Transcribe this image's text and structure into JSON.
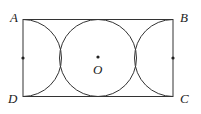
{
  "diagram": {
    "labels": {
      "A": "A",
      "B": "B",
      "C": "C",
      "D": "D",
      "O": "O"
    },
    "stroke_color": "#333333"
  }
}
